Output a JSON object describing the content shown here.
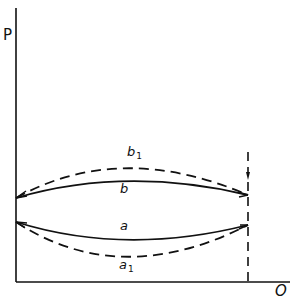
{
  "diagram": {
    "axes": {
      "y_label": "P",
      "x_label": "O"
    },
    "curves": [
      {
        "id": "b1",
        "label": "b",
        "subscript": "1",
        "style": "dashed",
        "shape": "convex-up"
      },
      {
        "id": "b",
        "label": "b",
        "subscript": "",
        "style": "solid",
        "shape": "convex-up"
      },
      {
        "id": "a",
        "label": "a",
        "subscript": "",
        "style": "solid",
        "shape": "convex-down"
      },
      {
        "id": "a1",
        "label": "a",
        "subscript": "1",
        "style": "dashed",
        "shape": "convex-down"
      }
    ],
    "boundary_line": {
      "style": "dashed",
      "orientation": "vertical"
    },
    "colors": {
      "ink": "#111111",
      "background": "#ffffff"
    }
  }
}
